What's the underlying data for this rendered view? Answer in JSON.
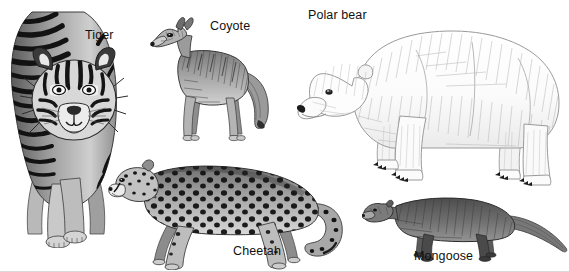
{
  "plate": {
    "title": "Carnivore species illustration plate",
    "background_color": "#ffffff",
    "ink_color": "#1a1a1a",
    "width": 569,
    "height": 272,
    "style": "grayscale pen-and-ink scientific illustration"
  },
  "figures": [
    {
      "id": "tiger",
      "label": "Tiger",
      "icon": "tiger-illustration",
      "pose": "walking toward viewer, front view",
      "tone": "dark striped orange-grey rendered in greyscale",
      "position": "far left"
    },
    {
      "id": "coyote",
      "label": "Coyote",
      "icon": "coyote-illustration",
      "pose": "standing in profile facing left",
      "tone": "medium grey grizzled coat",
      "position": "upper middle-left"
    },
    {
      "id": "polar-bear",
      "label": "Polar bear",
      "icon": "polar-bear-illustration",
      "pose": "walking in profile facing left",
      "tone": "white with fine grey fur hatching",
      "position": "upper right"
    },
    {
      "id": "cheetah",
      "label": "Cheetah",
      "icon": "cheetah-illustration",
      "pose": "stalking in profile facing left",
      "tone": "pale coat with dense black spots",
      "position": "lower middle"
    },
    {
      "id": "mongoose",
      "label": "Mongoose",
      "icon": "mongoose-illustration",
      "pose": "standing in profile facing left, long tapering tail",
      "tone": "dark grey-brown",
      "position": "lower right"
    }
  ]
}
